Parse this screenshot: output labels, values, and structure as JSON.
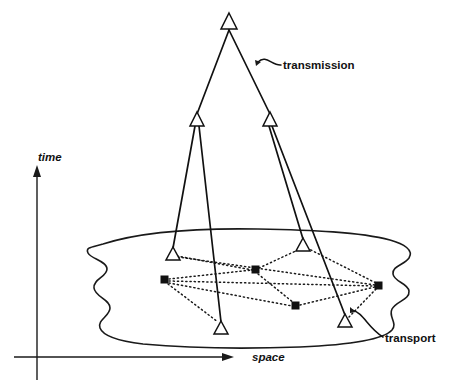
{
  "figure": {
    "title": "Layered transmission and transport network over space and time",
    "background_color": "#ffffff",
    "ink_color": "#111111",
    "width": 456,
    "height": 387
  },
  "axes": {
    "time": {
      "label": "time",
      "label_x": 38,
      "label_y": 158,
      "arrow_tip_x": 37,
      "arrow_tip_y": 168,
      "base_x": 37,
      "base_y": 380
    },
    "space": {
      "label": "space",
      "label_x": 252,
      "label_y": 358,
      "arrow_tip_x": 232,
      "arrow_tip_y": 357,
      "base_x": 14,
      "base_y": 357
    }
  },
  "callouts": [
    {
      "id": "transmission",
      "label": "transmission",
      "text_x": 283,
      "text_y": 66,
      "leader_path": "M 258 62 C 266 54 272 66 281 65"
    },
    {
      "id": "transport",
      "label": "transport",
      "text_x": 385,
      "text_y": 339,
      "leader_path": "M 352 310 C 364 313 367 327 383 337"
    }
  ],
  "cloud": {
    "name": "space-plane-cloud",
    "path": "M 103 244 C 140 232 200 228 258 229 C 312 230 360 232 390 240 C 404 244 414 250 409 258 C 404 265 392 266 393 274 C 394 282 408 283 409 291 C 410 300 396 301 392 309 C 388 317 398 323 392 330 C 383 340 346 345 300 347 C 245 349 186 348 143 344 C 118 341 103 336 100 328 C 97 320 110 316 110 308 C 110 299 95 297 94 288 C 93 279 107 277 107 269 C 107 261 91 259 88 253 C 85 247 93 247 103 244 Z"
  },
  "nodes": {
    "triangles": [
      {
        "id": "t-apex",
        "name": "transmission-node-apex",
        "x": 229,
        "y": 22,
        "size": 13
      },
      {
        "id": "t-mid-left",
        "name": "transmission-node-mid-left",
        "x": 197,
        "y": 120,
        "size": 12
      },
      {
        "id": "t-mid-right",
        "name": "transmission-node-mid-right",
        "x": 270,
        "y": 120,
        "size": 12
      },
      {
        "id": "t-low-left",
        "name": "transmission-node-low-left",
        "x": 173,
        "y": 254,
        "size": 11
      },
      {
        "id": "t-low-right",
        "name": "transmission-node-low-right",
        "x": 303,
        "y": 245,
        "size": 11
      },
      {
        "id": "t-bot-left",
        "name": "transmission-node-bottom-left",
        "x": 221,
        "y": 328,
        "size": 11
      },
      {
        "id": "t-bot-right",
        "name": "transmission-node-bottom-right",
        "x": 345,
        "y": 321,
        "size": 11
      }
    ],
    "squares": [
      {
        "id": "s-left",
        "name": "transport-node-left",
        "x": 165,
        "y": 280,
        "size": 6
      },
      {
        "id": "s-center",
        "name": "transport-node-center",
        "x": 256,
        "y": 270,
        "size": 6
      },
      {
        "id": "s-bottom",
        "name": "transport-node-bottom",
        "x": 296,
        "y": 306,
        "size": 6
      },
      {
        "id": "s-right",
        "name": "transport-node-right",
        "x": 379,
        "y": 286,
        "size": 6
      }
    ]
  },
  "links": {
    "transmission": [
      {
        "id": "tx-1",
        "from": "t-apex",
        "to": "t-mid-left",
        "x1": 229,
        "y1": 30,
        "x2": 197,
        "y2": 114
      },
      {
        "id": "tx-2",
        "from": "t-apex",
        "to": "t-mid-right",
        "x1": 229,
        "y1": 30,
        "x2": 270,
        "y2": 114
      },
      {
        "id": "tx-3",
        "from": "t-mid-left",
        "to": "t-low-left",
        "x1": 195,
        "y1": 126,
        "x2": 173,
        "y2": 248
      },
      {
        "id": "tx-4",
        "from": "t-mid-left",
        "to": "t-bot-left",
        "x1": 199,
        "y1": 126,
        "x2": 221,
        "y2": 322
      },
      {
        "id": "tx-5",
        "from": "t-mid-right",
        "to": "t-low-right",
        "x1": 269,
        "y1": 126,
        "x2": 303,
        "y2": 239
      },
      {
        "id": "tx-6",
        "from": "t-mid-right",
        "to": "t-bot-right",
        "x1": 272,
        "y1": 126,
        "x2": 345,
        "y2": 315
      }
    ],
    "transport": [
      {
        "id": "tp-1",
        "from": "t-low-left",
        "to": "s-center",
        "x1": 177,
        "y1": 256,
        "x2": 252,
        "y2": 270
      },
      {
        "id": "tp-2",
        "from": "t-low-left",
        "to": "s-right",
        "x1": 178,
        "y1": 257,
        "x2": 375,
        "y2": 285
      },
      {
        "id": "tp-3",
        "from": "s-left",
        "to": "s-center",
        "x1": 169,
        "y1": 279,
        "x2": 252,
        "y2": 270
      },
      {
        "id": "tp-4",
        "from": "s-left",
        "to": "s-right",
        "x1": 169,
        "y1": 281,
        "x2": 375,
        "y2": 286
      },
      {
        "id": "tp-5",
        "from": "s-left",
        "to": "s-bottom",
        "x1": 169,
        "y1": 283,
        "x2": 292,
        "y2": 306
      },
      {
        "id": "tp-6",
        "from": "s-left",
        "to": "t-bot-left",
        "x1": 168,
        "y1": 284,
        "x2": 218,
        "y2": 322
      },
      {
        "id": "tp-7",
        "from": "s-center",
        "to": "t-low-right",
        "x1": 259,
        "y1": 268,
        "x2": 300,
        "y2": 249
      },
      {
        "id": "tp-8",
        "from": "s-center",
        "to": "s-bottom",
        "x1": 258,
        "y1": 274,
        "x2": 294,
        "y2": 303
      },
      {
        "id": "tp-9",
        "from": "t-low-right",
        "to": "s-right",
        "x1": 307,
        "y1": 248,
        "x2": 376,
        "y2": 283
      },
      {
        "id": "tp-10",
        "from": "s-bottom",
        "to": "s-right",
        "x1": 300,
        "y1": 305,
        "x2": 375,
        "y2": 287
      },
      {
        "id": "tp-11",
        "from": "s-right",
        "to": "t-bot-right",
        "x1": 376,
        "y1": 289,
        "x2": 349,
        "y2": 317
      }
    ]
  }
}
